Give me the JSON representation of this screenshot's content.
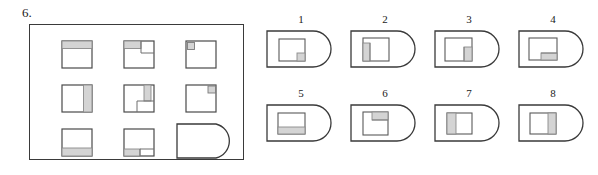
{
  "question": {
    "number_label": "6.",
    "type": "visual-analogy-matrix"
  },
  "colors": {
    "stroke": "#3a3a3a",
    "stroke_light": "#6e6e6e",
    "shade_fill": "#d4d4d4",
    "background": "#ffffff",
    "text": "#1a1a1a"
  },
  "matrix": {
    "rows": 3,
    "cols": 3,
    "cells": [
      {
        "id": "cell-1",
        "row": 1,
        "col": 1,
        "shape": "square",
        "shaded_region": "top-band",
        "description": "square with shaded horizontal band across the top"
      },
      {
        "id": "cell-2",
        "row": 1,
        "col": 2,
        "shape": "square",
        "shaded_region": "top-left-band-with-notch",
        "description": "square with shaded band top-left and inner square outline at top-right"
      },
      {
        "id": "cell-3",
        "row": 1,
        "col": 3,
        "shape": "square",
        "shaded_region": "top-left-small-square",
        "description": "square with small shaded square in the top-left corner"
      },
      {
        "id": "cell-4",
        "row": 2,
        "col": 1,
        "shape": "square",
        "shaded_region": "right-vertical-band",
        "description": "square with shaded vertical band on the right side"
      },
      {
        "id": "cell-5",
        "row": 2,
        "col": 2,
        "shape": "square",
        "shaded_region": "upper-right-vertical-band",
        "description": "square with shaded vertical band in the upper-right quadrant"
      },
      {
        "id": "cell-6",
        "row": 2,
        "col": 3,
        "shape": "square",
        "shaded_region": "top-right-small-square",
        "description": "square with small shaded square in the top-right corner"
      },
      {
        "id": "cell-7",
        "row": 3,
        "col": 1,
        "shape": "square",
        "shaded_region": "bottom-band",
        "description": "square with shaded horizontal band across the bottom"
      },
      {
        "id": "cell-8",
        "row": 3,
        "col": 2,
        "shape": "square",
        "shaded_region": "bottom-left-band",
        "description": "square with shaded band along the bottom-left"
      },
      {
        "id": "cell-9",
        "row": 3,
        "col": 3,
        "shape": "d-shape",
        "shaded_region": "none",
        "description": "empty rounded-right D shape — the missing element"
      }
    ]
  },
  "options": {
    "count": 8,
    "items": [
      {
        "label": "1",
        "shape": "d-shape",
        "inner": "square",
        "shaded_region": "bottom-right-small-square",
        "description": "D shape containing a square with a small shaded square at bottom-right"
      },
      {
        "label": "2",
        "shape": "d-shape",
        "inner": "square",
        "shaded_region": "left-vertical-band-upper",
        "description": "D shape containing a square with a shaded vertical band on the left"
      },
      {
        "label": "3",
        "shape": "d-shape",
        "inner": "square",
        "shaded_region": "right-vertical-band-lower",
        "description": "D shape containing a square with a shaded vertical band on the lower right"
      },
      {
        "label": "4",
        "shape": "d-shape",
        "inner": "square",
        "shaded_region": "bottom-right-band",
        "description": "D shape containing a square with a shaded band along the bottom-right"
      },
      {
        "label": "5",
        "shape": "d-shape",
        "inner": "square",
        "shaded_region": "bottom-band",
        "description": "D shape containing a square with a shaded horizontal band across the bottom"
      },
      {
        "label": "6",
        "shape": "d-shape",
        "inner": "square",
        "shaded_region": "top-right-band",
        "description": "D shape containing a square with a shaded band across the top-right"
      },
      {
        "label": "7",
        "shape": "d-shape",
        "inner": "square",
        "shaded_region": "left-vertical-band",
        "description": "D shape containing a square with a shaded vertical band on the left"
      },
      {
        "label": "8",
        "shape": "d-shape",
        "inner": "square",
        "shaded_region": "right-vertical-band",
        "description": "D shape containing a square with a shaded vertical band on the right"
      }
    ]
  }
}
